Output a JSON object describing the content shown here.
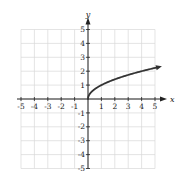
{
  "chart_data": {
    "type": "line",
    "title": "",
    "function": "y = sqrt(x)",
    "xlabel": "x",
    "ylabel": "y",
    "xlim": [
      -5,
      5
    ],
    "ylim": [
      -5,
      5
    ],
    "grid": true,
    "x_ticks": [
      -5,
      -4,
      -3,
      -2,
      -1,
      1,
      2,
      3,
      4,
      5
    ],
    "y_ticks": [
      -5,
      -4,
      -3,
      -2,
      -1,
      1,
      2,
      3,
      4,
      5
    ],
    "x_tick_labels": [
      "-5",
      "-4",
      "-3",
      "-2",
      "-1",
      "1",
      "2",
      "3",
      "4",
      "5"
    ],
    "y_tick_labels": [
      "-5",
      "-4",
      "-3",
      "-2",
      "-1",
      "1",
      "2",
      "3",
      "4",
      "5"
    ],
    "series": [
      {
        "name": "sqrt(x)",
        "x": [
          0,
          0.25,
          0.5,
          1,
          2,
          3,
          4,
          5,
          5.3
        ],
        "y": [
          0,
          0.5,
          0.71,
          1,
          1.41,
          1.73,
          2,
          2.24,
          2.3
        ],
        "end_arrow": true,
        "color": "#333333"
      }
    ]
  }
}
